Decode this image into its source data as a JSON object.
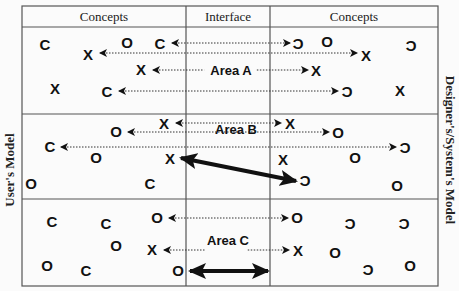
{
  "diagram": {
    "header": {
      "left_label": "Concepts",
      "center_label": "Interface",
      "right_label": "Concepts"
    },
    "side_labels": {
      "left": "User's Model",
      "right": "Designer's/System's Model"
    },
    "colors": {
      "ink": "#111111",
      "border": "#555555",
      "background": "#fbfbfb"
    },
    "areas": [
      {
        "label": "Area A",
        "description": "Concepts mapped via dotted arrows through interface",
        "left_symbols": [
          {
            "glyph": "C",
            "x": 45,
            "y": 50
          },
          {
            "glyph": "X",
            "x": 88,
            "y": 60
          },
          {
            "glyph": "O",
            "x": 127,
            "y": 48
          },
          {
            "glyph": "C",
            "x": 160,
            "y": 49
          },
          {
            "glyph": "X",
            "x": 141,
            "y": 75
          },
          {
            "glyph": "X",
            "x": 55,
            "y": 94
          },
          {
            "glyph": "C",
            "x": 107,
            "y": 97
          }
        ],
        "right_symbols": [
          {
            "glyph": "ɔ",
            "x": 298,
            "y": 49
          },
          {
            "glyph": "O",
            "x": 327,
            "y": 47
          },
          {
            "glyph": "X",
            "x": 366,
            "y": 61
          },
          {
            "glyph": "ɔ",
            "x": 411,
            "y": 51
          },
          {
            "glyph": "X",
            "x": 316,
            "y": 76
          },
          {
            "glyph": "ɔ",
            "x": 347,
            "y": 97
          },
          {
            "glyph": "X",
            "x": 400,
            "y": 96
          }
        ]
      },
      {
        "label": "Area B",
        "description": "Includes a thick mismatched mapping arrow",
        "left_symbols": [
          {
            "glyph": "X",
            "x": 164,
            "y": 129
          },
          {
            "glyph": "O",
            "x": 116,
            "y": 137
          },
          {
            "glyph": "C",
            "x": 50,
            "y": 152
          },
          {
            "glyph": "O",
            "x": 96,
            "y": 163
          },
          {
            "glyph": "X",
            "x": 170,
            "y": 164
          },
          {
            "glyph": "O",
            "x": 31,
            "y": 189
          },
          {
            "glyph": "C",
            "x": 150,
            "y": 189
          }
        ],
        "right_symbols": [
          {
            "glyph": "X",
            "x": 290,
            "y": 129
          },
          {
            "glyph": "O",
            "x": 338,
            "y": 138
          },
          {
            "glyph": "ɔ",
            "x": 405,
            "y": 153
          },
          {
            "glyph": "X",
            "x": 283,
            "y": 165
          },
          {
            "glyph": "O",
            "x": 355,
            "y": 163
          },
          {
            "glyph": "ɔ",
            "x": 305,
            "y": 186
          },
          {
            "glyph": "O",
            "x": 397,
            "y": 191
          }
        ]
      },
      {
        "label": "Area C",
        "description": "Includes a thick two-headed arrow inside the interface",
        "left_symbols": [
          {
            "glyph": "C",
            "x": 52,
            "y": 227
          },
          {
            "glyph": "C",
            "x": 106,
            "y": 229
          },
          {
            "glyph": "O",
            "x": 157,
            "y": 223
          },
          {
            "glyph": "O",
            "x": 116,
            "y": 251
          },
          {
            "glyph": "X",
            "x": 152,
            "y": 255
          },
          {
            "glyph": "O",
            "x": 47,
            "y": 271
          },
          {
            "glyph": "C",
            "x": 86,
            "y": 276
          },
          {
            "glyph": "O",
            "x": 178,
            "y": 276
          }
        ],
        "right_symbols": [
          {
            "glyph": "O",
            "x": 297,
            "y": 223
          },
          {
            "glyph": "ɔ",
            "x": 350,
            "y": 229
          },
          {
            "glyph": "ɔ",
            "x": 404,
            "y": 229
          },
          {
            "glyph": "X",
            "x": 298,
            "y": 256
          },
          {
            "glyph": "O",
            "x": 335,
            "y": 258
          },
          {
            "glyph": "ɔ",
            "x": 368,
            "y": 275
          },
          {
            "glyph": "O",
            "x": 410,
            "y": 271
          }
        ]
      }
    ],
    "arrows": [
      {
        "type": "dotted-double",
        "x1": 172,
        "x2": 290,
        "y": 43
      },
      {
        "type": "dotted-double",
        "x1": 100,
        "x2": 357,
        "y": 53
      },
      {
        "type": "dotted-double-labeled",
        "x1": 153,
        "x2": 308,
        "y": 70,
        "label_ref": "Area A"
      },
      {
        "type": "dotted-double",
        "x1": 119,
        "x2": 338,
        "y": 91
      },
      {
        "type": "dotted-double",
        "x1": 176,
        "x2": 281,
        "y": 123
      },
      {
        "type": "dotted-double",
        "x1": 128,
        "x2": 329,
        "y": 132
      },
      {
        "type": "dotted-double",
        "x1": 61,
        "x2": 396,
        "y": 147
      },
      {
        "type": "thick-diagonal-double",
        "x1": 181,
        "y1": 158,
        "x2": 296,
        "y2": 181
      },
      {
        "type": "dotted-double",
        "x1": 169,
        "x2": 288,
        "y": 218
      },
      {
        "type": "dotted-double-labeled",
        "x1": 164,
        "x2": 289,
        "y": 250,
        "label_ref": "Area C"
      },
      {
        "type": "thick-double",
        "x1": 190,
        "x2": 268,
        "y": 271
      }
    ]
  }
}
